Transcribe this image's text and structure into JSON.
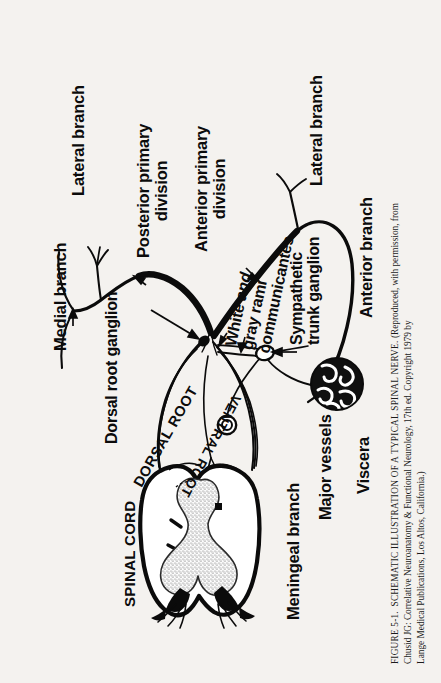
{
  "figure": {
    "number_label": "FIGURE 5-1.",
    "caption_smallcaps_lead": "SCHEMATIC ILLUSTRATION OF A TYPICAL SPINAL NERVE.",
    "caption_line_1": "SCHEMATIC ILLUSTRATION OF A TYPICAL SPINAL NERVE. (Reproduced, with permission, from",
    "caption_line_2": "Chusid JG: Correlative Neuroanatomy & Functional Neurology, 17th ed. Copyright 1979 by",
    "caption_line_3": "Lange Medical Publications, Los Altos, California.)",
    "source_author": "Chusid JG",
    "source_title": "Correlative Neuroanatomy & Functional Neurology",
    "source_edition": "17th ed.",
    "source_copyright_year": "1979",
    "source_publisher": "Lange Medical Publications",
    "source_city": "Los Altos, California"
  },
  "labels": {
    "lateral_branch_posterior": "Lateral branch",
    "medial_branch": "Medial branch",
    "posterior_primary_division_l1": "Posterior primary",
    "posterior_primary_division_l2": "division",
    "anterior_primary_division_l1": "Anterior primary",
    "anterior_primary_division_l2": "division",
    "dorsal_root_ganglion": "Dorsal root ganglion",
    "dorsal_root": "DORSAL ROOT",
    "ventral_root": "VENTRAL ROOT",
    "spinal_cord": "SPINAL CORD",
    "meningeal_branch": "Meningeal branch",
    "white_rami_l1_a": "White ",
    "white_rami_l1_b": "and",
    "white_rami_l2": "gray rami",
    "white_rami_l3": "communicantes",
    "sympathetic_trunk_ganglion_l1": "Sympathetic",
    "sympathetic_trunk_ganglion_l2": "trunk ganglion",
    "major_vessels": "Major vessels",
    "viscera": "Viscera",
    "lateral_branch_anterior": "Lateral branch",
    "anterior_branch": "Anterior branch"
  },
  "colors": {
    "page_background": "#f4f2ef",
    "ink": "#0b0b0b",
    "gray_matter_stipple": "#6b6b6b",
    "viscera_fill": "#101010",
    "white_matter_fill": "#ffffff"
  },
  "diagram": {
    "type": "schematic-anatomical-diagram",
    "orientation": "rotated-90-degrees-counterclockwise",
    "structures": [
      "spinal cord cross-section with butterfly gray matter",
      "dorsal root",
      "dorsal root ganglion",
      "ventral root",
      "spinal nerve trunk",
      "posterior primary division",
      "medial branch",
      "lateral branch (posterior)",
      "anterior primary division",
      "lateral branch (anterior)",
      "anterior branch",
      "white and gray rami communicantes",
      "sympathetic trunk ganglion",
      "meningeal branch",
      "major vessels",
      "viscera"
    ]
  }
}
